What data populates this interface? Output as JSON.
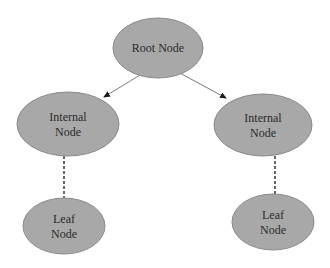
{
  "diagram": {
    "type": "tree",
    "colors": {
      "background": "#ffffff",
      "node_fill": "#a8a8a8",
      "node_stroke": "#8a8a8a",
      "edge": "#7a7a7a",
      "text": "#2b2b2b"
    },
    "nodes": [
      {
        "id": "root",
        "lines": [
          "Root Node"
        ]
      },
      {
        "id": "internal-left",
        "lines": [
          "Internal",
          "Node"
        ]
      },
      {
        "id": "internal-right",
        "lines": [
          "Internal",
          "Node"
        ]
      },
      {
        "id": "leaf-left",
        "lines": [
          "Leaf",
          "Node"
        ]
      },
      {
        "id": "leaf-right",
        "lines": [
          "Leaf",
          "Node"
        ]
      }
    ],
    "edges": [
      {
        "from": "root",
        "to": "internal-left",
        "style": "solid-arrow"
      },
      {
        "from": "root",
        "to": "internal-right",
        "style": "solid-arrow"
      },
      {
        "from": "internal-left",
        "to": "leaf-left",
        "style": "dashed"
      },
      {
        "from": "internal-right",
        "to": "leaf-right",
        "style": "dashed"
      }
    ]
  }
}
